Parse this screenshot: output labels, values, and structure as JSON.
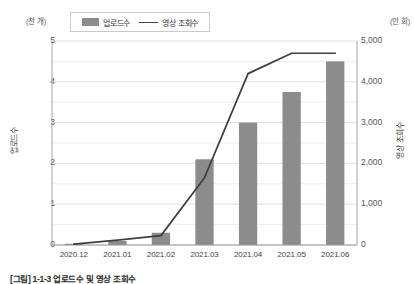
{
  "units": {
    "left": "(천 개)",
    "right": "(만 회)"
  },
  "legend": {
    "bar_label": "업로드수",
    "line_label": "영상 조회수"
  },
  "axis_titles": {
    "left": "업로드수",
    "right": "영상 조회수"
  },
  "caption": "[그림] 1-1-3 업로드수 및 영상 조회수",
  "colors": {
    "bar": "#8c8c8c",
    "line": "#3f3f3f",
    "gridline": "#d9d9d9",
    "minor_gridline": "#e8e8e8",
    "axis": "#9a9a9a",
    "text": "#555555"
  },
  "chart_data": {
    "type": "bar",
    "title": "",
    "subtitle": "",
    "xlabel": "",
    "ylabel": "업로드수",
    "categories": [
      "2020.12",
      "2021.01",
      "2021.02",
      "2021.03",
      "2021.04",
      "2021.05",
      "2021.06"
    ],
    "series": [
      {
        "name": "업로드수",
        "type": "bar",
        "axis": "left",
        "unit": "천 개",
        "values": [
          0.03,
          0.1,
          0.3,
          2.1,
          3.0,
          3.75,
          4.5
        ]
      },
      {
        "name": "영상 조회수",
        "type": "line",
        "axis": "right",
        "unit": "만 회",
        "values": [
          20,
          120,
          230,
          1650,
          4200,
          4700,
          4700
        ]
      }
    ],
    "left_axis": {
      "label": "업로드수",
      "unit": "(천 개)",
      "ticks": [
        "0",
        "1",
        "2",
        "3",
        "4",
        "5"
      ],
      "tick_values": [
        0,
        1,
        2,
        3,
        4,
        5
      ],
      "minor_tick_values": [
        0.5,
        1.5,
        2.5,
        3.5,
        4.5
      ],
      "ylim": [
        0,
        5
      ]
    },
    "right_axis": {
      "label": "영상 조회수",
      "unit": "(만 회)",
      "ticks": [
        "0",
        "1,000",
        "2,000",
        "3,000",
        "4,000",
        "5,000"
      ],
      "tick_values": [
        0,
        1000,
        2000,
        3000,
        4000,
        5000
      ],
      "ylim": [
        0,
        5000
      ]
    },
    "grid": true,
    "legend_position": "top-left"
  }
}
